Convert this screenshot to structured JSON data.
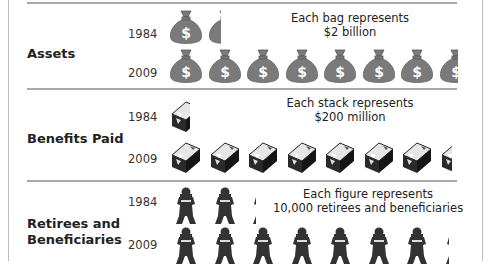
{
  "chart_data": {
    "type": "pictograph",
    "title": "",
    "categories": [
      "Assets",
      "Benefits Paid",
      "Retirees and Beneficiaries"
    ],
    "years": [
      "1984",
      "2009"
    ],
    "series": [
      {
        "name": "Assets",
        "unit_label": "Each bag represents $2 billion",
        "unit_value": 2,
        "unit": "billion dollars",
        "icon": "money-bag",
        "icon_counts": {
          "1984": 1.4,
          "2009": 7.6
        },
        "values": {
          "1984": 2.8,
          "2009": 15.2
        }
      },
      {
        "name": "Benefits Paid",
        "unit_label": "Each stack represents $200 million",
        "unit_value": 200,
        "unit": "million dollars",
        "icon": "cash-stack",
        "icon_counts": {
          "1984": 0.6,
          "2009": 7.4
        },
        "values": {
          "1984": 120,
          "2009": 1480
        }
      },
      {
        "name": "Retirees and Beneficiaries",
        "unit_label": "Each figure represents 10,000 retirees and beneficiaries",
        "unit_value": 10000,
        "unit": "people",
        "icon": "person-figure",
        "icon_counts": {
          "1984": 2.3,
          "2009": 7.3
        },
        "values": {
          "1984": 23000,
          "2009": 73000
        }
      }
    ],
    "grid": false,
    "legend_position": "inline-right"
  },
  "sections": [
    {
      "label": "Assets",
      "note_line1": "Each bag represents",
      "note_line2": "$2 billion",
      "rows": [
        {
          "year": "1984",
          "count": 1.4
        },
        {
          "year": "2009",
          "count": 7.6
        }
      ],
      "icon_color": "#7a7a7a"
    },
    {
      "label": "Benefits Paid",
      "note_line1": "Each stack represents",
      "note_line2": "$200 million",
      "rows": [
        {
          "year": "1984",
          "count": 0.6
        },
        {
          "year": "2009",
          "count": 7.4
        }
      ],
      "icon_color": "#2b2b2b"
    },
    {
      "label_line1": "Retirees and",
      "label_line2": "Beneficiaries",
      "note_line1": "Each figure represents",
      "note_line2": "10,000 retirees and beneficiaries",
      "rows": [
        {
          "year": "1984",
          "count": 2.3
        },
        {
          "year": "2009",
          "count": 7.3
        }
      ],
      "icon_color": "#333333"
    }
  ],
  "side_credit": "Copyright ©"
}
